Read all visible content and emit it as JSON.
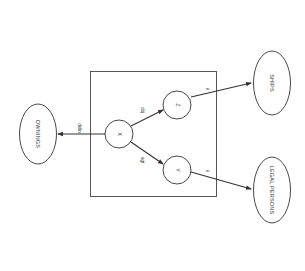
{
  "diagram": {
    "type": "semantic-network",
    "orientation": "rotated-90-clockwise",
    "colors": {
      "stroke": "#333333",
      "background": "#ffffff"
    },
    "box": {
      "label": ""
    },
    "nodes": {
      "x": {
        "label": "X"
      },
      "y": {
        "label": "Y"
      },
      "z": {
        "label": "Z"
      },
      "ownings": {
        "label": "OWNINGS"
      },
      "ships": {
        "label": "SHIPS"
      },
      "legal_persons": {
        "label": "LEGAL PERSONS"
      }
    },
    "edges": {
      "x_to_ownings": {
        "from": "X",
        "to": "OWNINGS",
        "label": "delin"
      },
      "x_to_z": {
        "from": "X",
        "to": "Z",
        "label": "obj"
      },
      "x_to_y": {
        "from": "X",
        "to": "Y",
        "label": "agt"
      },
      "z_to_ships": {
        "from": "Z",
        "to": "SHIPS",
        "label": "e"
      },
      "y_to_legal_persons": {
        "from": "Y",
        "to": "LEGAL PERSONS",
        "label": "e"
      }
    }
  }
}
